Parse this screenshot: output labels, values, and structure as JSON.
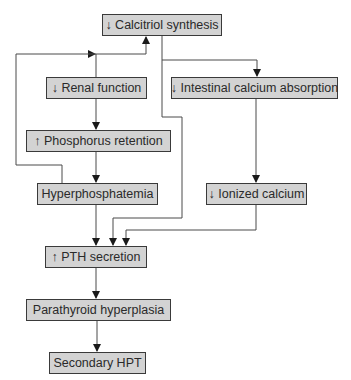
{
  "diagram": {
    "nodes": [
      {
        "id": "calcitriol",
        "label": "↓ Calcitriol synthesis",
        "x": 102,
        "y": 14,
        "w": 120,
        "h": 22
      },
      {
        "id": "renal",
        "label": "↓ Renal function",
        "x": 46,
        "y": 77,
        "w": 101,
        "h": 22
      },
      {
        "id": "intestinal",
        "label": "↓ Intestinal calcium absorption",
        "x": 171,
        "y": 77,
        "w": 167,
        "h": 22
      },
      {
        "id": "phosphorus",
        "label": "↑ Phosphorus retention",
        "x": 26,
        "y": 130,
        "w": 145,
        "h": 22
      },
      {
        "id": "hyperphos",
        "label": "Hyperphosphatemia",
        "x": 37,
        "y": 183,
        "w": 121,
        "h": 22
      },
      {
        "id": "ionized",
        "label": "↓ Ionized calcium",
        "x": 206,
        "y": 183,
        "w": 101,
        "h": 22
      },
      {
        "id": "pth",
        "label": "↑ PTH secretion",
        "x": 45,
        "y": 246,
        "w": 102,
        "h": 22
      },
      {
        "id": "parathyroid",
        "label": "Parathyroid hyperplasia",
        "x": 26,
        "y": 299,
        "w": 145,
        "h": 22
      },
      {
        "id": "secondary",
        "label": "Secondary HPT",
        "x": 49,
        "y": 352,
        "w": 97,
        "h": 22
      }
    ],
    "edges": [
      {
        "from": "renal",
        "to": "calcitriol",
        "path": "M96,77 L96,54 L146,54 L146,37",
        "mid_arrow": [
          96,
          54,
          "right"
        ]
      },
      {
        "from": "hyperphos",
        "to": "calcitriol",
        "path": "M62,183 L62,165 L16,165 L16,54 L96,54"
      },
      {
        "from": "calcitriol",
        "to": "intestinal",
        "path": "M162,36 L162,60 L257,60 L257,76"
      },
      {
        "from": "calcitriol",
        "to": "pth",
        "path": "M162,60 L162,117 L182,117 L182,218 L113,218 L113,245"
      },
      {
        "from": "renal",
        "to": "phosphorus",
        "path": "M96,99 L96,129"
      },
      {
        "from": "phosphorus",
        "to": "hyperphos",
        "path": "M96,152 L96,182"
      },
      {
        "from": "intestinal",
        "to": "ionized",
        "path": "M256,99 L256,182"
      },
      {
        "from": "hyperphos",
        "to": "pth",
        "path": "M96,205 L96,245"
      },
      {
        "from": "ionized",
        "to": "pth",
        "path": "M256,205 L256,230 L126,230 L126,245"
      },
      {
        "from": "pth",
        "to": "parathyroid",
        "path": "M96,268 L96,298"
      },
      {
        "from": "parathyroid",
        "to": "secondary",
        "path": "M97,321 L97,351"
      }
    ],
    "colors": {
      "box_fill": "#d3d3d3",
      "box_border": "#3a3a3a",
      "line": "#4a4a4a",
      "arrow": "#1a1a1a"
    }
  }
}
